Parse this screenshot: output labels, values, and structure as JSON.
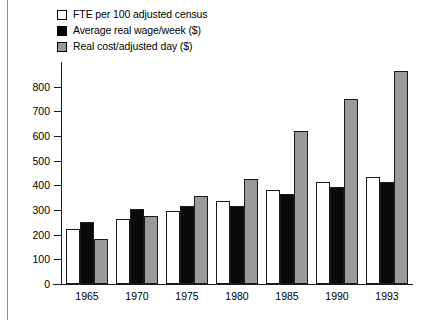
{
  "chart_data": {
    "type": "bar",
    "title": "",
    "subtitle": "",
    "xlabel": "",
    "ylabel": "",
    "categories": [
      "1965",
      "1970",
      "1975",
      "1980",
      "1985",
      "1990",
      "1993"
    ],
    "ylim": [
      0,
      900
    ],
    "ytick_values": [
      0,
      100,
      200,
      300,
      400,
      500,
      600,
      700,
      800
    ],
    "ytick_labels": [
      "0",
      "100",
      "200",
      "300",
      "400",
      "500",
      "600",
      "700",
      "800"
    ],
    "grid": false,
    "legend_position": "top-left",
    "series": [
      {
        "name": "FTE per 100 adjusted census",
        "color": "#ffffff",
        "values": [
          225,
          265,
          295,
          335,
          380,
          415,
          435
        ]
      },
      {
        "name": "Average real wage/week ($)",
        "color": "#0a0a0a",
        "values": [
          253,
          305,
          315,
          315,
          365,
          395,
          415
        ]
      },
      {
        "name": "Real cost/adjusted day ($)",
        "color": "#9a9a9a",
        "values": [
          182,
          275,
          355,
          425,
          620,
          750,
          865
        ]
      }
    ]
  },
  "legend": {
    "items": [
      {
        "label": "FTE per 100 adjusted census",
        "swatch": "white-swatch-icon"
      },
      {
        "label": "Average real wage/week ($)",
        "swatch": "black-swatch-icon"
      },
      {
        "label": "Real cost/adjusted day ($)",
        "swatch": "gray-swatch-icon"
      }
    ]
  }
}
